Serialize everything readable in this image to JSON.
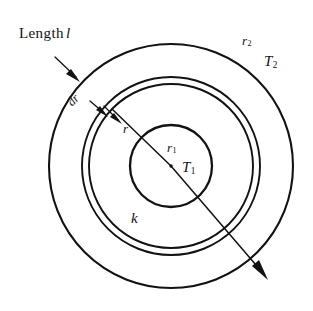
{
  "figure": {
    "background_color": "#ffffff",
    "ink_color": "#121212",
    "geometry": {
      "center": {
        "x": 171,
        "y": 166
      },
      "radius_outer": 122,
      "radius_annulus_outer": 89,
      "radius_annulus_inner": 82,
      "radius_inner": 41
    }
  },
  "labels": {
    "length": {
      "text": "Length",
      "variable": "l"
    },
    "dr": {
      "text": "dr"
    },
    "r": {
      "text": "r"
    },
    "r1": {
      "base": "r",
      "sub": "1"
    },
    "r2": {
      "base": "r",
      "sub": "2"
    },
    "t1": {
      "base": "T",
      "sub": "1"
    },
    "t2": {
      "base": "T",
      "sub": "2"
    },
    "k": {
      "text": "k"
    },
    "qdot": {
      "text": "Q"
    }
  }
}
